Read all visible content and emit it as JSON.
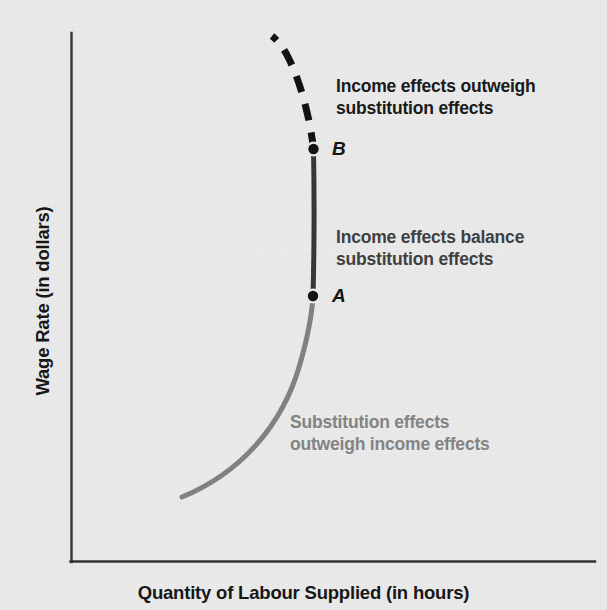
{
  "chart_data": {
    "type": "line",
    "title": "",
    "subtitle": "",
    "xlabel": "Quantity of Labour Supplied (in hours)",
    "ylabel": "Wage Rate (in dollars)",
    "grid": false,
    "legend_position": "none",
    "axis_ranges": {
      "x": [
        0,
        100
      ],
      "y": [
        0,
        100
      ]
    },
    "annotations": [
      {
        "id": "income-outweigh",
        "text": "Income effects outweigh\nsubstitution effects",
        "color": "#151515",
        "segment": "dashed-upper"
      },
      {
        "id": "income-balance",
        "text": "Income effects balance\nsubstitution effects",
        "color": "#3c3c3c",
        "segment": "vertical-middle"
      },
      {
        "id": "substitution-outweigh",
        "text": "Substitution effects\noutweigh income effects",
        "color": "#828282",
        "segment": "gray-lower"
      }
    ],
    "points": [
      {
        "label": "A",
        "x": 51.2,
        "y": 50.3
      },
      {
        "label": "B",
        "x": 51.2,
        "y": 78.1
      }
    ],
    "series": [
      {
        "name": "Substitution effects outweigh income effects",
        "style": "solid",
        "color": "#808080",
        "width": 5,
        "path": "M 182 497 C 238 474, 282 428, 300 364 C 308 336, 312 314, 313 296"
      },
      {
        "name": "Income effects balance substitution effects",
        "style": "solid",
        "color": "#333333",
        "width": 5,
        "path": "M 313 296 C 314 258, 314.5 205, 313.5 149"
      },
      {
        "name": "Income effects outweigh substitution effects",
        "style": "dashed",
        "color": "#0d0d0d",
        "width": 7,
        "dash": "17 12",
        "path": "M 313.5 149 C 310 118, 300 80, 288 57 C 283 47, 277 40, 272 36"
      }
    ]
  },
  "axes": {
    "y_title": "Wage Rate (in dollars)",
    "x_title": "Quantity of Labour Supplied (in hours)",
    "axis_color": "#2f2f2f"
  },
  "colors": {
    "background": "#ebebeb",
    "substitution_gray": "#808080",
    "balance_dark": "#333333",
    "income_black": "#0d0d0d",
    "axis": "#2f2f2f"
  }
}
